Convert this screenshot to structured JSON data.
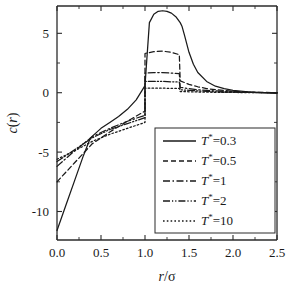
{
  "chart_data": {
    "type": "line",
    "title": "",
    "xlabel": "r/σ",
    "ylabel": "c(r)",
    "xlim": [
      0.0,
      2.5
    ],
    "ylim": [
      -12.4,
      7.3
    ],
    "xticks": [
      "0.0",
      "0.5",
      "1.0",
      "1.5",
      "2.0",
      "2.5"
    ],
    "xtick_values": [
      0.0,
      0.5,
      1.0,
      1.5,
      2.0,
      2.5
    ],
    "yticks": [
      "5",
      "0",
      "-5",
      "-10"
    ],
    "ytick_values": [
      5,
      0,
      -5,
      -10
    ],
    "grid": false,
    "legend_position": "lower-right",
    "legend_title": "",
    "series": [
      {
        "name": "T*=0.3",
        "label_symbol": "T",
        "label_superscript": "*",
        "label_value": "=0.3",
        "dash": "solid",
        "dasharray": "none",
        "x": [
          0.0,
          0.1,
          0.2,
          0.3,
          0.38,
          0.5,
          0.6,
          0.7,
          0.8,
          0.9,
          1.0,
          1.0,
          1.05,
          1.1,
          1.15,
          1.2,
          1.25,
          1.3,
          1.35,
          1.4,
          1.42,
          1.45,
          1.5,
          1.55,
          1.6,
          1.7,
          1.8,
          1.9,
          2.0,
          2.2,
          2.5
        ],
        "y": [
          -11.6,
          -9.5,
          -7.4,
          -5.3,
          -3.8,
          -3.0,
          -2.5,
          -2.0,
          -1.4,
          -0.6,
          0.6,
          0.6,
          5.9,
          6.6,
          6.85,
          6.9,
          6.85,
          6.7,
          6.4,
          5.9,
          5.6,
          4.8,
          3.4,
          2.4,
          1.7,
          0.95,
          0.55,
          0.35,
          0.2,
          0.05,
          -0.05
        ]
      },
      {
        "name": "T*=0.5",
        "label_symbol": "T",
        "label_superscript": "*",
        "label_value": "=0.5",
        "dash": "dashed",
        "dasharray": "5,3",
        "x": [
          0.0,
          0.2,
          0.4,
          0.6,
          0.8,
          1.0,
          1.0,
          1.1,
          1.2,
          1.3,
          1.39,
          1.4,
          1.45,
          1.5,
          1.6,
          1.7,
          1.8,
          2.0,
          2.2,
          2.5
        ],
        "y": [
          -7.5,
          -5.9,
          -4.3,
          -3.3,
          -2.4,
          -1.55,
          3.3,
          3.45,
          3.5,
          3.4,
          3.2,
          1.0,
          0.85,
          0.7,
          0.5,
          0.35,
          0.25,
          0.12,
          0.05,
          0.0
        ]
      },
      {
        "name": "T*=1",
        "label_symbol": "T",
        "label_superscript": "*",
        "label_value": "=1",
        "dash": "dash-dot",
        "dasharray": "7,2.5,1.5,2.5",
        "x": [
          0.0,
          0.2,
          0.4,
          0.6,
          0.8,
          1.0,
          1.0,
          1.1,
          1.2,
          1.3,
          1.39,
          1.4,
          1.5,
          1.6,
          1.7,
          1.8,
          2.0,
          2.2,
          2.5
        ],
        "y": [
          -6.2,
          -4.9,
          -3.7,
          -3.0,
          -2.4,
          -1.9,
          1.65,
          1.7,
          1.7,
          1.65,
          1.6,
          0.45,
          0.35,
          0.25,
          0.2,
          0.15,
          0.08,
          0.03,
          0.0
        ]
      },
      {
        "name": "T*=2",
        "label_symbol": "T",
        "label_superscript": "*",
        "label_value": "=2",
        "dash": "dash-dot-dot",
        "dasharray": "7,2,1.2,2,1.2,2",
        "x": [
          0.0,
          0.2,
          0.4,
          0.6,
          0.8,
          1.0,
          1.0,
          1.1,
          1.2,
          1.3,
          1.39,
          1.4,
          1.5,
          1.6,
          1.7,
          1.8,
          2.0,
          2.2,
          2.5
        ],
        "y": [
          -5.8,
          -4.8,
          -3.8,
          -3.1,
          -2.6,
          -2.1,
          0.95,
          0.95,
          0.95,
          0.92,
          0.9,
          0.25,
          0.2,
          0.15,
          0.12,
          0.08,
          0.04,
          0.02,
          0.0
        ]
      },
      {
        "name": "T*=10",
        "label_symbol": "T",
        "label_superscript": "*",
        "label_value": "=10",
        "dash": "dotted",
        "dasharray": "1.6,2.2",
        "x": [
          0.0,
          0.2,
          0.4,
          0.6,
          0.8,
          1.0,
          1.0,
          1.1,
          1.2,
          1.3,
          1.39,
          1.4,
          1.5,
          1.6,
          1.7,
          1.8,
          2.0,
          2.2,
          2.5
        ],
        "y": [
          -5.6,
          -4.9,
          -4.1,
          -3.5,
          -3.0,
          -2.5,
          0.38,
          0.38,
          0.38,
          0.37,
          0.36,
          0.1,
          0.08,
          0.06,
          0.05,
          0.03,
          0.02,
          0.01,
          0.0
        ]
      }
    ]
  },
  "legend": {
    "items": [
      {
        "label": "T*=0.3",
        "symbol": "T",
        "sup": "*",
        "value": "=0.3"
      },
      {
        "label": "T*=0.5",
        "symbol": "T",
        "sup": "*",
        "value": "=0.5"
      },
      {
        "label": "T*=1",
        "symbol": "T",
        "sup": "*",
        "value": "=1"
      },
      {
        "label": "T*=2",
        "symbol": "T",
        "sup": "*",
        "value": "=2"
      },
      {
        "label": "T*=10",
        "symbol": "T",
        "sup": "*",
        "value": "=10"
      }
    ]
  },
  "axes": {
    "x_title": "r/σ",
    "y_title": "c(r)",
    "y_title_italic_c": "c",
    "y_title_paren_open": "(",
    "y_title_italic_r": "r",
    "y_title_paren_close": ")",
    "x_title_italic_r": "r",
    "x_title_slash": "/",
    "x_title_sigma": "σ"
  },
  "style": {
    "line_color": "#1a1a1a",
    "axis_color": "#2b2b2b",
    "background": "#ffffff"
  }
}
